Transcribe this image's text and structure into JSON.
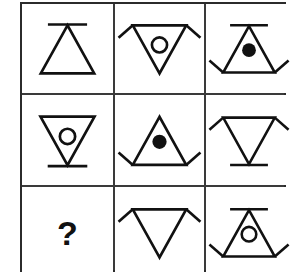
{
  "puzzle": {
    "title": "Matrix Reasoning Puzzle",
    "type": "3x3-matrix",
    "rows": 3,
    "columns": 3,
    "stroke_color": "#111111",
    "grid_line_color": "#3a3a3a",
    "background_color": "#ffffff",
    "missing_cell_label": "?",
    "cells": [
      {
        "index": 1,
        "position": "row1-col1",
        "name": "cell-r1c1",
        "shape": "triangle",
        "orientation": "up",
        "inner": "none",
        "bar": "apex",
        "wings": "none",
        "description": "Upward triangle with horizontal bar at top apex"
      },
      {
        "index": 2,
        "position": "row1-col2",
        "name": "cell-r1c2",
        "shape": "triangle",
        "orientation": "down",
        "inner": "open-circle",
        "bar": "none",
        "wings": "top",
        "description": "Downward triangle with open circle and wings at top corners"
      },
      {
        "index": 3,
        "position": "row1-col3",
        "name": "cell-r1c3",
        "shape": "triangle",
        "orientation": "up",
        "inner": "filled-dot",
        "bar": "apex",
        "wings": "bottom",
        "description": "Upward triangle with bar at apex, filled dot and wings at bottom corners"
      },
      {
        "index": 4,
        "position": "row2-col1",
        "name": "cell-r2c1",
        "shape": "triangle",
        "orientation": "down",
        "inner": "open-circle",
        "bar": "apex",
        "wings": "none",
        "description": "Downward triangle with open circle and bar at bottom apex"
      },
      {
        "index": 5,
        "position": "row2-col2",
        "name": "cell-r2c2",
        "shape": "triangle",
        "orientation": "up",
        "inner": "filled-dot",
        "bar": "none",
        "wings": "bottom",
        "description": "Upward triangle with filled dot and wings at bottom corners"
      },
      {
        "index": 6,
        "position": "row2-col3",
        "name": "cell-r2c3",
        "shape": "triangle",
        "orientation": "down",
        "inner": "none",
        "bar": "apex",
        "wings": "top",
        "description": "Downward triangle with wings at top corners and bar at bottom apex"
      },
      {
        "index": 7,
        "position": "row3-col1",
        "name": "cell-r3c1",
        "shape": "question",
        "orientation": "none",
        "inner": "none",
        "bar": "none",
        "wings": "none",
        "description": "Missing element shown as bold question mark"
      },
      {
        "index": 8,
        "position": "row3-col2",
        "name": "cell-r3c2",
        "shape": "triangle",
        "orientation": "down",
        "inner": "none",
        "bar": "none",
        "wings": "top",
        "description": "Downward triangle with wings at top corners"
      },
      {
        "index": 9,
        "position": "row3-col3",
        "name": "cell-r3c3",
        "shape": "triangle",
        "orientation": "up",
        "inner": "open-circle",
        "bar": "apex",
        "wings": "bottom",
        "description": "Upward triangle with bar at apex, open circle and wings at bottom corners"
      }
    ]
  }
}
